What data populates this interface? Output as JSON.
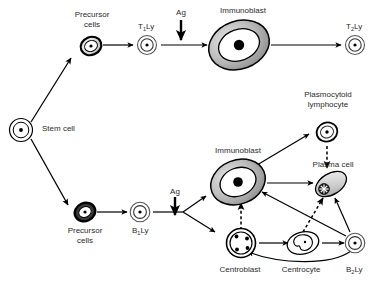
{
  "diagram": {
    "background_color": "#ffffff",
    "line_color": "#000000",
    "label_color": "#2b2b2b",
    "cell_fill_gray": "#a8a8a8",
    "cell_fill_light": "#d9d9d9",
    "nodes": {
      "stem_cell": {
        "label": "Stem cell",
        "x": 42,
        "y": 128
      },
      "t_precursor": {
        "label_line1": "Precursor",
        "label_line2": "cells",
        "x": 92,
        "y": 41
      },
      "t1ly": {
        "label": "T",
        "label_sub": "1",
        "label_tail": "Ly",
        "x": 146,
        "y": 41
      },
      "ag_top": {
        "label": "Ag",
        "x": 181,
        "y": 12
      },
      "immunoblast_top": {
        "label": "Immunoblast",
        "x": 243,
        "y": 43
      },
      "t2ly": {
        "label": "T",
        "label_sub": "2",
        "label_tail": "Ly",
        "x": 353,
        "y": 42
      },
      "b_precursor": {
        "label_line1": "Precursor",
        "label_line2": "cells",
        "x": 85,
        "y": 228
      },
      "b1ly": {
        "label": "B",
        "label_sub": "1",
        "label_tail": "Ly",
        "x": 140,
        "y": 228
      },
      "ag_bottom": {
        "label": "Ag",
        "x": 175,
        "y": 190
      },
      "immunoblast_mid": {
        "label": "Immunoblast",
        "x": 238,
        "y": 180
      },
      "plasmocytoid": {
        "label_line1": "Plasmocytoid",
        "label_line2": "lymphocyte",
        "x": 328,
        "y": 123
      },
      "plasma_cell": {
        "label": "Plasma cell",
        "x": 331,
        "y": 183
      },
      "centroblast": {
        "label": "Centroblast",
        "x": 240,
        "y": 260
      },
      "centrocyte": {
        "label": "Centrocyte",
        "x": 294,
        "y": 258
      },
      "b2ly": {
        "label": "B",
        "label_sub": "2",
        "label_tail": "Ly",
        "x": 353,
        "y": 258
      }
    }
  }
}
